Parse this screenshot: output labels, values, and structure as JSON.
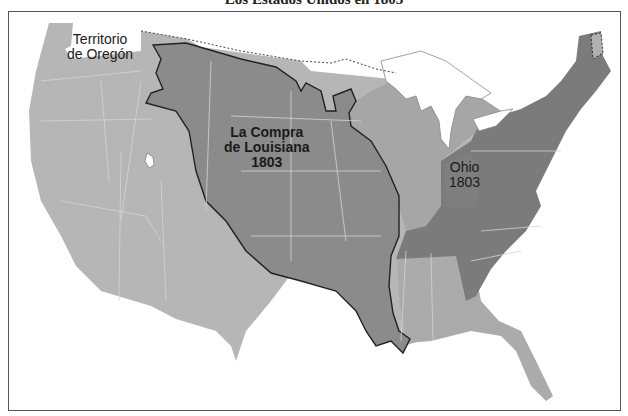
{
  "title": "Los Estados Unidos en 1803",
  "colors": {
    "oregon_territory_and_west": "#b4b4b4",
    "louisiana_purchase": "#8a8a8a",
    "states_1803": "#7c7c7c",
    "territories_east": "#a6a6a6",
    "water_background": "#ffffff",
    "border_line": "#2a2a2a",
    "state_lines": "#d8d8d8"
  },
  "labels": {
    "oregon": {
      "line1": "Territorio",
      "line2": "de Oregón"
    },
    "louisiana": {
      "line1": "La Compra",
      "line2": "de Louisiana",
      "line3": "1803"
    },
    "ohio": {
      "line1": "Ohio",
      "line2": "1803"
    }
  },
  "legend_regions": [
    {
      "name": "Territorio de Oregón",
      "shade": "light gray"
    },
    {
      "name": "La Compra de Louisiana 1803",
      "shade": "medium gray, bold outline"
    },
    {
      "name": "Ohio 1803",
      "shade": "dark gray"
    },
    {
      "name": "Original states",
      "shade": "dark gray"
    }
  ]
}
